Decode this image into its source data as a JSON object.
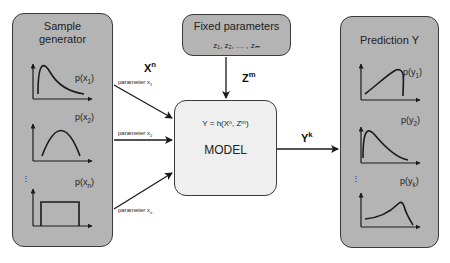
{
  "sample_generator": {
    "title_line1": "Sample",
    "title_line2": "generator",
    "distributions": [
      {
        "label": "p(x",
        "sub": "1",
        "shape": "right-skewed"
      },
      {
        "label": "p(x",
        "sub": "2",
        "shape": "parabola"
      },
      {
        "label": "p(x",
        "sub": "n",
        "shape": "uniform"
      }
    ],
    "ellipsis": "⋮"
  },
  "fixed_parameters": {
    "title": "Fixed parameters",
    "values": "z₁, z₂, … , zₘ"
  },
  "model": {
    "equation": "Y = h(Xⁿ, Zᵐ)",
    "label": "MODEL"
  },
  "prediction": {
    "title": "Prediction Y",
    "distributions": [
      {
        "label": "p(y",
        "sub": "1",
        "shape": "left-skewed-cutoff"
      },
      {
        "label": "p(y",
        "sub": "2",
        "shape": "right-skewed"
      },
      {
        "label": "p(y",
        "sub": "k",
        "shape": "left-skewed"
      }
    ],
    "ellipsis": "⋮"
  },
  "arrows": {
    "xn_label": "X",
    "xn_sup": "n",
    "zm_label": "Z",
    "zm_sup": "m",
    "yk_label": "Y",
    "yk_sup": "k",
    "param1": "parameter x",
    "param1_sub": "1",
    "param2": "parameter x",
    "param2_sub": "2",
    "paramn": "parameter x",
    "paramn_sub": "n"
  },
  "colors": {
    "box_gray": "#b4b4b4",
    "model_bg": "#efefef",
    "stroke": "#1a1a1a"
  }
}
